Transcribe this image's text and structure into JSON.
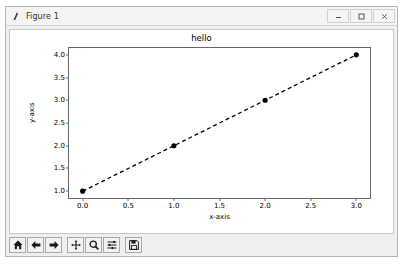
{
  "window": {
    "title": "Figure 1",
    "icon": "matplotlib-logo-icon",
    "controls": [
      {
        "name": "minimize-button",
        "glyph": "–"
      },
      {
        "name": "maximize-button",
        "glyph": "☐"
      },
      {
        "name": "close-button",
        "glyph": "✕"
      }
    ]
  },
  "toolbar": {
    "buttons": [
      {
        "name": "home-button",
        "label": "Home"
      },
      {
        "name": "back-button",
        "label": "Back"
      },
      {
        "name": "forward-button",
        "label": "Forward"
      },
      {
        "name": "pan-button",
        "label": "Pan"
      },
      {
        "name": "zoom-button",
        "label": "Zoom"
      },
      {
        "name": "configure-subplots-button",
        "label": "Configure subplots"
      },
      {
        "name": "save-button",
        "label": "Save"
      }
    ],
    "message": ""
  },
  "chart_data": {
    "type": "line",
    "title": "hello",
    "xlabel": "x-axis",
    "ylabel": "y-axis",
    "grid": false,
    "legend": null,
    "marker": "o",
    "linestyle": "--",
    "color": "#000000",
    "x": [
      0,
      1,
      2,
      3
    ],
    "y": [
      1,
      2,
      3,
      4
    ],
    "series": [
      {
        "name": "series-1",
        "x": [
          0,
          1,
          2,
          3
        ],
        "values": [
          1,
          2,
          3,
          4
        ]
      }
    ],
    "xlim": [
      -0.15,
      3.15
    ],
    "ylim": [
      0.85,
      4.15
    ],
    "xticks": [
      0.0,
      0.5,
      1.0,
      1.5,
      2.0,
      2.5,
      3.0
    ],
    "xticklabels": [
      "0.0",
      "0.5",
      "1.0",
      "1.5",
      "2.0",
      "2.5",
      "3.0"
    ],
    "yticks": [
      1.0,
      1.5,
      2.0,
      2.5,
      3.0,
      3.5,
      4.0
    ],
    "yticklabels": [
      "1.0",
      "1.5",
      "2.0",
      "2.5",
      "3.0",
      "3.5",
      "4.0"
    ]
  }
}
